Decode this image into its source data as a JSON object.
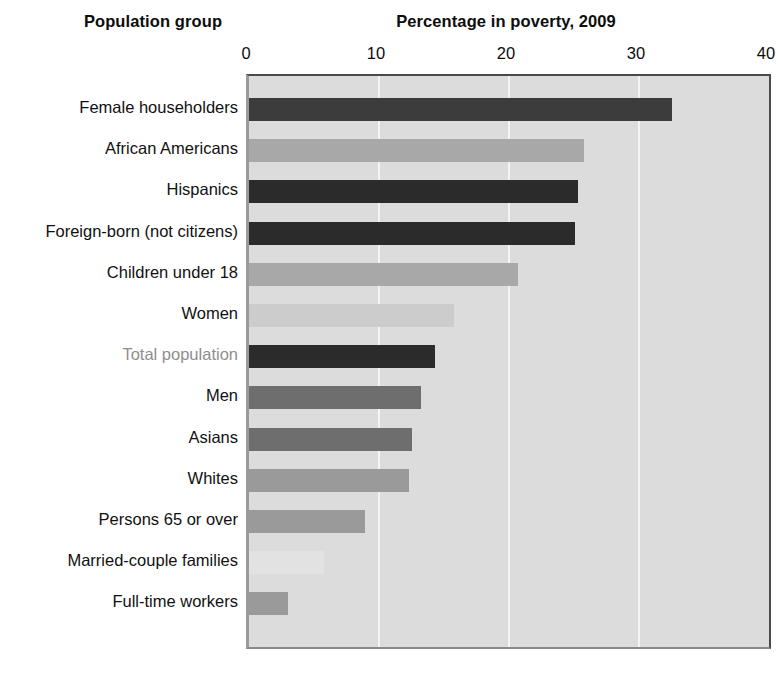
{
  "header": {
    "group_title": "Population group",
    "value_title": "Percentage in poverty, 2009"
  },
  "axis": {
    "ticks": [
      "0",
      "10",
      "20",
      "30",
      "40"
    ],
    "min": 0,
    "max": 40,
    "step": 10
  },
  "colors": {
    "plot_background": "#dcdcdc",
    "gridline": "#f4f4f4",
    "plot_border": "#4a4a4a",
    "label_text": "#111111",
    "label_text_muted": "#8e8e8e",
    "bar_very_dark": "#2b2b2b",
    "bar_dark": "#3c3c3c",
    "bar_medium_dark": "#5c5c5c",
    "bar_medium": "#6e6e6e",
    "bar_gray": "#9a9a9a",
    "bar_light_gray": "#a8a8a8",
    "bar_lighter": "#b8b8b8",
    "bar_pale": "#cccccc",
    "bar_very_pale": "#e2e2e2"
  },
  "chart_data": {
    "type": "bar",
    "orientation": "horizontal",
    "title": "Percentage in poverty, 2009",
    "xlabel": "Percentage in poverty, 2009",
    "ylabel": "Population group",
    "xlim": [
      0,
      40
    ],
    "xticks": [
      0,
      10,
      20,
      30,
      40
    ],
    "grid": true,
    "legend": "none",
    "categories": [
      "Female householders",
      "African Americans",
      "Hispanics",
      "Foreign-born (not citizens)",
      "Children under 18",
      "Women",
      "Total population",
      "Men",
      "Asians",
      "Whites",
      "Persons 65 or over",
      "Married-couple families",
      "Full-time workers"
    ],
    "values": [
      32.5,
      25.8,
      25.3,
      25.1,
      20.7,
      15.8,
      14.3,
      13.2,
      12.5,
      12.3,
      8.9,
      5.8,
      3.0
    ],
    "bar_colors": [
      "#3c3c3c",
      "#a8a8a8",
      "#2b2b2b",
      "#2b2b2b",
      "#a8a8a8",
      "#cccccc",
      "#2b2b2b",
      "#6e6e6e",
      "#6e6e6e",
      "#9a9a9a",
      "#9a9a9a",
      "#e2e2e2",
      "#9a9a9a"
    ],
    "label_muted": [
      false,
      false,
      false,
      false,
      false,
      false,
      true,
      false,
      false,
      false,
      false,
      false,
      false
    ]
  }
}
